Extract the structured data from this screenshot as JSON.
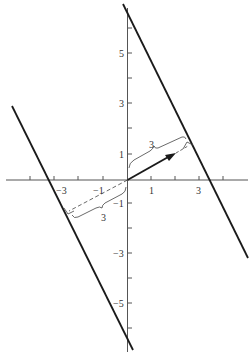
{
  "diagram": {
    "colors": {
      "line": "#1a1a1a",
      "axis": "#555555",
      "text": "#333333",
      "background": "#ffffff"
    },
    "x_axis": {
      "tick_labels": [
        {
          "value": "−3",
          "x": 54
        },
        {
          "value": "−1",
          "x": 103
        },
        {
          "value": "1",
          "x": 151
        },
        {
          "value": "3",
          "x": 199
        }
      ]
    },
    "y_axis": {
      "tick_labels": [
        {
          "value": "5",
          "y": 53
        },
        {
          "value": "3",
          "y": 103
        },
        {
          "value": "1",
          "y": 154
        },
        {
          "value": "−1",
          "y": 203
        },
        {
          "value": "−3",
          "y": 253
        },
        {
          "value": "−5",
          "y": 303
        }
      ]
    },
    "distance_labels": {
      "upper": "3",
      "lower": "3"
    }
  }
}
